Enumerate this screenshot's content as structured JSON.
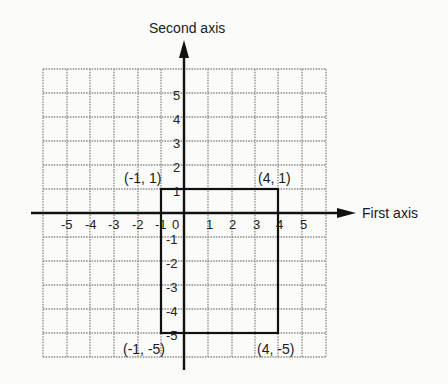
{
  "diagram": {
    "axes": {
      "x_label": "First axis",
      "y_label": "Second axis",
      "x_ticks": [
        "-5",
        "-4",
        "-3",
        "-2",
        "-1",
        "0",
        "1",
        "2",
        "3",
        "4",
        "5"
      ],
      "y_ticks_positive": [
        "1",
        "2",
        "3",
        "4",
        "5"
      ],
      "y_ticks_negative": [
        "-1",
        "-2",
        "-3",
        "-4",
        "-5"
      ]
    },
    "grid": {
      "x_min": -6,
      "x_max": 6,
      "y_min": -6,
      "y_max": 6,
      "line_color": "#8a8a8a",
      "style": "dotted"
    },
    "rectangle": {
      "corners": [
        {
          "label": "(-1, 1)",
          "x": -1,
          "y": 1
        },
        {
          "label": "(4, 1)",
          "x": 4,
          "y": 1
        },
        {
          "label": "(-1, -5)",
          "x": -1,
          "y": -5
        },
        {
          "label": "(4, -5)",
          "x": 4,
          "y": -5
        }
      ],
      "stroke_color": "#111111"
    }
  }
}
